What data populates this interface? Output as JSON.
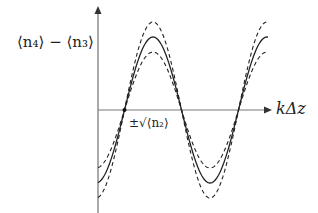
{
  "diagram": {
    "y_axis_label": "⟨n₄⟩ − ⟨n₃⟩",
    "x_axis_label": "kΔz",
    "error_label": "±√⟨n₂⟩",
    "colors": {
      "axis": "#555555",
      "curve": "#222222",
      "band": "#222222",
      "background": "#ffffff"
    },
    "curves": [
      {
        "name": "mean",
        "style": "solid"
      },
      {
        "name": "upper-bound",
        "style": "dashed"
      },
      {
        "name": "lower-bound",
        "style": "dashed"
      }
    ]
  }
}
